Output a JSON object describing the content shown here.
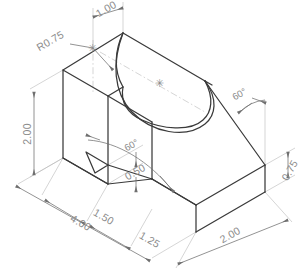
{
  "drawing": {
    "title": "Isometric part drawing",
    "view_type": "isometric",
    "line_color": "#3a3a3a",
    "dimension_color": "#8c8c8c",
    "background_color": "#ffffff"
  },
  "dimensions": [
    {
      "id": "top-width",
      "label": "1.00",
      "kind": "linear",
      "rotation": -30
    },
    {
      "id": "radius-top",
      "label": "R0.75",
      "kind": "radius",
      "rotation": -30
    },
    {
      "id": "height-left",
      "label": "2.00",
      "kind": "linear",
      "rotation": -90
    },
    {
      "id": "overall-length",
      "label": "4.00",
      "kind": "linear",
      "rotation": 30
    },
    {
      "id": "notch-offset",
      "label": "1.50",
      "kind": "linear",
      "rotation": 30
    },
    {
      "id": "notch-width",
      "label": "1.25",
      "kind": "linear",
      "rotation": 30
    },
    {
      "id": "notch-depth",
      "label": "0.50",
      "kind": "linear",
      "rotation": -30
    },
    {
      "id": "base-thickness",
      "label": "0.75",
      "kind": "linear",
      "rotation": -60
    },
    {
      "id": "depth-right",
      "label": "2.00",
      "kind": "linear",
      "rotation": -30
    },
    {
      "id": "angle-slope",
      "label": "60°",
      "kind": "angular",
      "rotation": -30
    },
    {
      "id": "angle-notch",
      "label": "60°",
      "kind": "angular",
      "rotation": -30
    }
  ],
  "center_marks": [
    {
      "id": "center-mark-radius",
      "glyph": "✳"
    },
    {
      "id": "center-mark-slot",
      "glyph": "✳"
    }
  ]
}
